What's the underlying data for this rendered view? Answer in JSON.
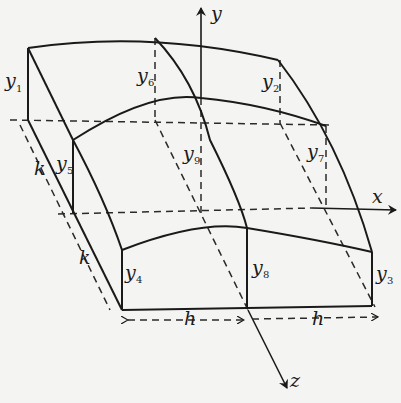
{
  "figure": {
    "axes": {
      "x": "x",
      "y": "y",
      "z": "z"
    },
    "spacing": {
      "h": "h",
      "k": "k"
    },
    "ordinates": [
      {
        "id": "y1",
        "base": "y",
        "sub": "1"
      },
      {
        "id": "y2",
        "base": "y",
        "sub": "2"
      },
      {
        "id": "y3",
        "base": "y",
        "sub": "3"
      },
      {
        "id": "y4",
        "base": "y",
        "sub": "4"
      },
      {
        "id": "y5",
        "base": "y",
        "sub": "5"
      },
      {
        "id": "y6",
        "base": "y",
        "sub": "6"
      },
      {
        "id": "y7",
        "base": "y",
        "sub": "7"
      },
      {
        "id": "y8",
        "base": "y",
        "sub": "8"
      },
      {
        "id": "y9",
        "base": "y",
        "sub": "9"
      }
    ],
    "colors": {
      "ink": "#1a1a1a",
      "paper": "#f4f4f2"
    }
  }
}
